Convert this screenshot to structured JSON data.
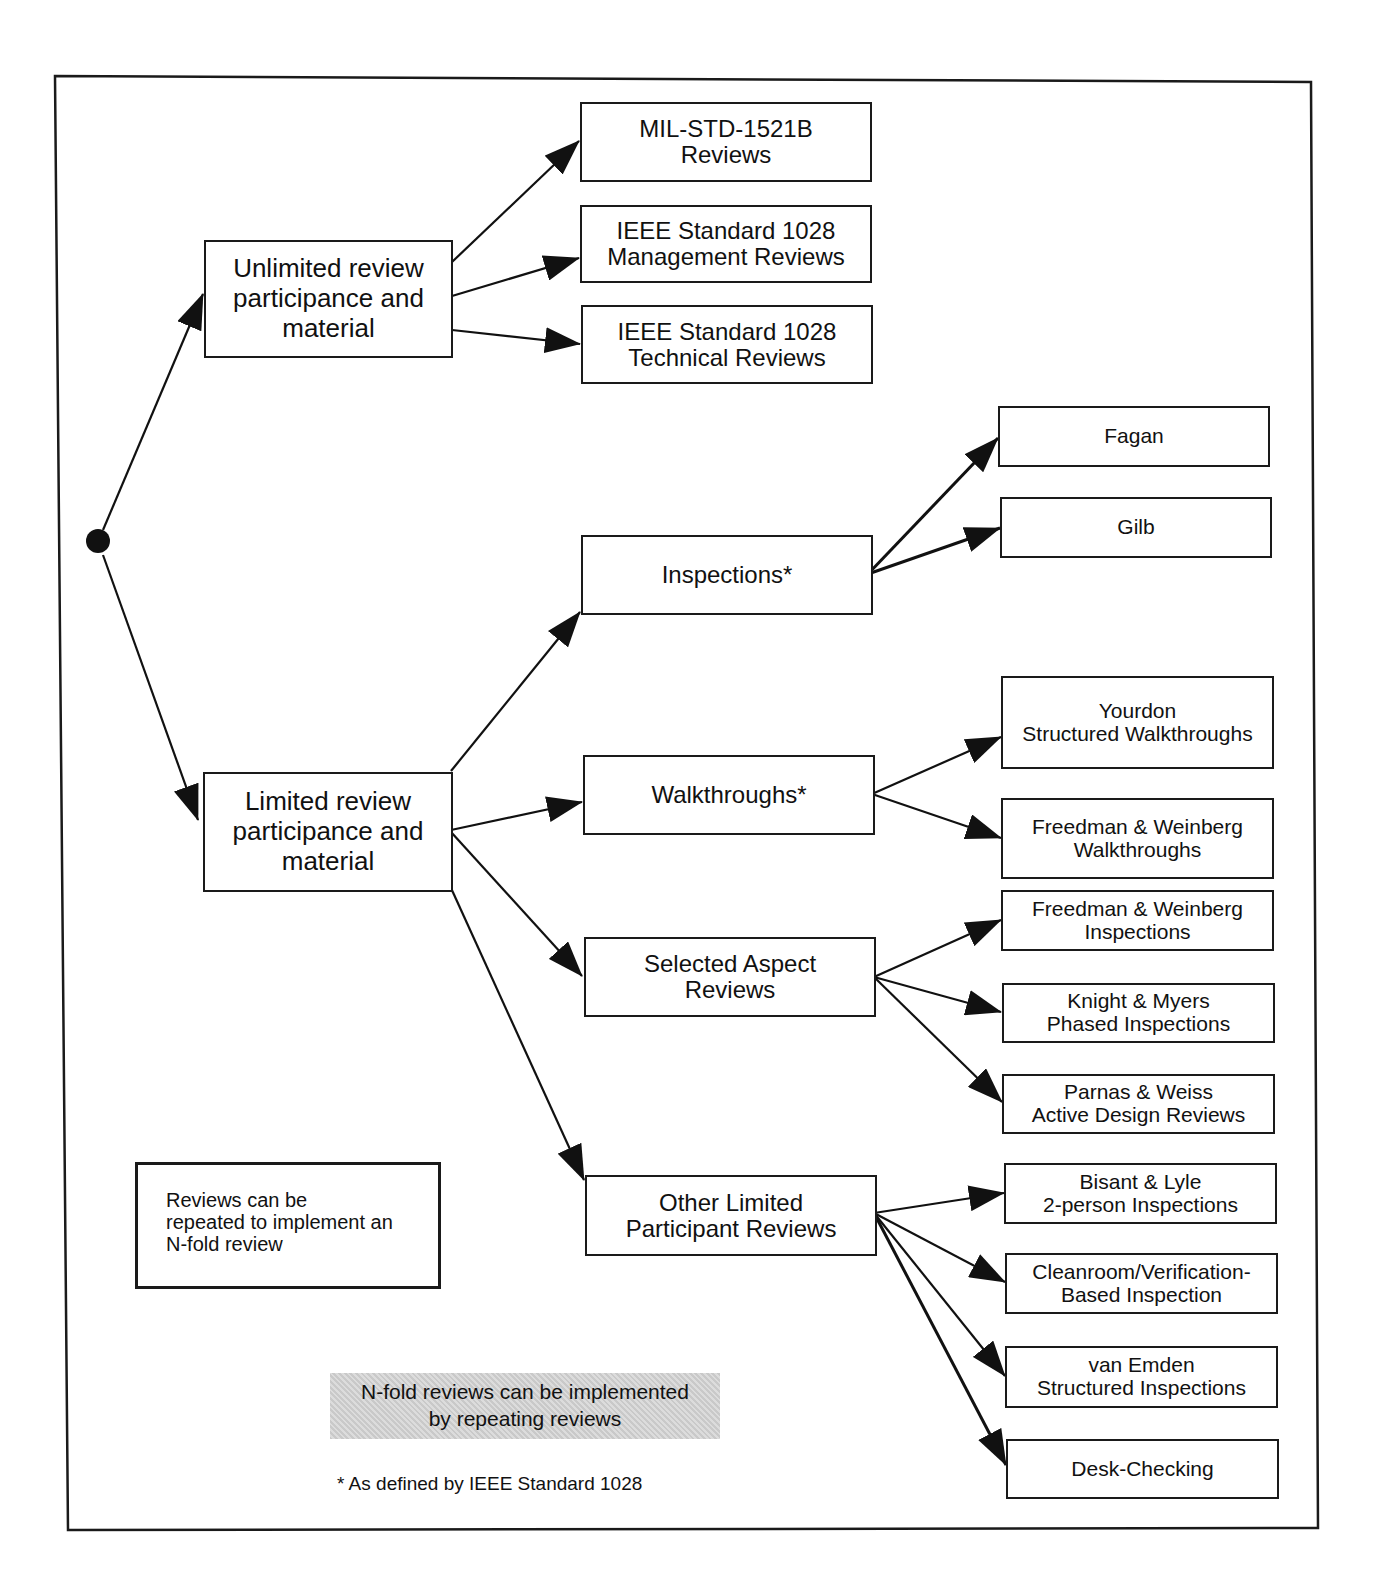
{
  "diagram": {
    "root": {
      "shape": "filled-circle"
    },
    "level1": {
      "unlimited": {
        "label": "Unlimited review\nparticipance and\nmaterial"
      },
      "limited": {
        "label": "Limited review\nparticipance and\nmaterial"
      }
    },
    "unlimited_children": [
      {
        "label": "MIL-STD-1521B\nReviews"
      },
      {
        "label": "IEEE Standard 1028\nManagement Reviews"
      },
      {
        "label": "IEEE Standard 1028\nTechnical Reviews"
      }
    ],
    "limited_children": {
      "inspections": {
        "label": "Inspections*"
      },
      "walkthroughs": {
        "label": "Walkthroughs*"
      },
      "selected_aspect": {
        "label": "Selected Aspect\nReviews"
      },
      "other_limited": {
        "label": "Other Limited\nParticipant Reviews"
      }
    },
    "inspections_children": [
      {
        "label": "Fagan"
      },
      {
        "label": "Gilb"
      }
    ],
    "walkthroughs_children": [
      {
        "label": "Yourdon\nStructured Walkthroughs"
      },
      {
        "label": "Freedman & Weinberg\nWalkthroughs"
      }
    ],
    "selected_aspect_children": [
      {
        "label": "Freedman & Weinberg\nInspections"
      },
      {
        "label": "Knight & Myers\nPhased Inspections"
      },
      {
        "label": "Parnas & Weiss\nActive Design Reviews"
      }
    ],
    "other_limited_children": [
      {
        "label": "Bisant & Lyle\n2-person Inspections"
      },
      {
        "label": "Cleanroom/Verification-\nBased Inspection"
      },
      {
        "label": "van Emden\nStructured Inspections"
      },
      {
        "label": "Desk-Checking"
      }
    ],
    "notes": {
      "repeat_box": "Reviews can be\nrepeated to implement an\nN-fold review",
      "shaded_note": "N-fold reviews can be implemented\nby repeating reviews",
      "footnote": "* As defined by IEEE Standard 1028"
    },
    "colors": {
      "line": "#1a1a1a",
      "background": "#ffffff",
      "shade": "#d0d0d0"
    }
  }
}
